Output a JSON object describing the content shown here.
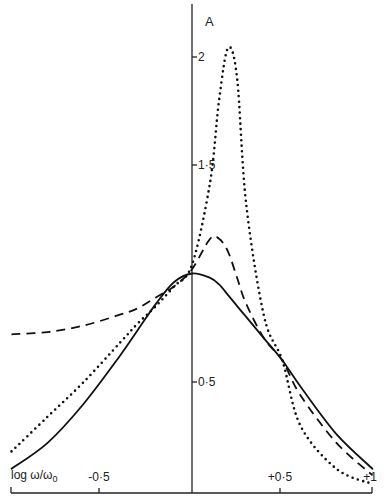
{
  "chart_data": {
    "type": "line",
    "title": "",
    "xlabel": "log ω/ω0",
    "ylabel": "A",
    "xlim": [
      -1,
      1
    ],
    "ylim": [
      0,
      2.2
    ],
    "grid": false,
    "legend": null,
    "x_ticks": [
      {
        "value": -0.5,
        "label": "-0·5"
      },
      {
        "value": 0.5,
        "label": "+0·5"
      },
      {
        "value": 1,
        "label": "+1"
      }
    ],
    "y_ticks": [
      {
        "value": 0.5,
        "label": "0·5"
      },
      {
        "value": 1.5,
        "label": "1·5"
      },
      {
        "value": 2,
        "label": "2"
      }
    ],
    "x": [
      -1.0,
      -0.8,
      -0.6,
      -0.4,
      -0.3,
      -0.2,
      -0.1,
      0.0,
      0.1,
      0.15,
      0.2,
      0.25,
      0.3,
      0.4,
      0.5,
      0.6,
      0.8,
      1.0
    ],
    "series": [
      {
        "name": "solid",
        "style": "solid",
        "values": [
          0.1,
          0.22,
          0.4,
          0.62,
          0.74,
          0.86,
          0.96,
          1.0,
          0.98,
          0.95,
          0.9,
          0.85,
          0.8,
          0.7,
          0.6,
          0.48,
          0.26,
          0.1
        ]
      },
      {
        "name": "dashed",
        "style": "dashed",
        "values": [
          0.72,
          0.73,
          0.76,
          0.81,
          0.84,
          0.89,
          0.94,
          1.02,
          1.16,
          1.16,
          1.1,
          0.98,
          0.86,
          0.7,
          0.6,
          0.44,
          0.22,
          0.07
        ]
      },
      {
        "name": "dotted",
        "style": "dotted",
        "values": [
          0.18,
          0.34,
          0.5,
          0.68,
          0.77,
          0.85,
          0.94,
          1.04,
          1.42,
          1.8,
          2.04,
          1.9,
          1.32,
          0.8,
          0.6,
          0.3,
          0.1,
          0.03
        ]
      }
    ],
    "annotations": []
  },
  "axis": {
    "y_title": "A",
    "x_title_main": "log ω/ω",
    "x_title_sub": "0",
    "x_labels": [
      "-0·5",
      "+0·5",
      "+1"
    ],
    "y_labels": [
      "2",
      "1·5",
      "0·5"
    ]
  }
}
